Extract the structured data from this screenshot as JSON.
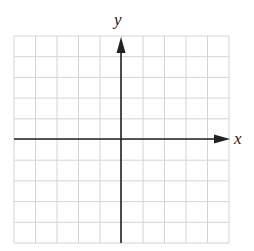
{
  "chart_data": {
    "type": "scatter",
    "title": "",
    "xlabel": "x",
    "ylabel": "y",
    "xlim": [
      -5,
      5
    ],
    "ylim": [
      -5,
      5
    ],
    "grid": true,
    "grid_lines": 10,
    "series": [],
    "annotations": [
      "Blank coordinate plane with x and y axes and arrows in positive direction"
    ]
  },
  "axes": {
    "x_label": "x",
    "y_label": "y"
  },
  "colors": {
    "grid": "#d4d4d4",
    "axis": "#222222",
    "background": "#ffffff"
  }
}
